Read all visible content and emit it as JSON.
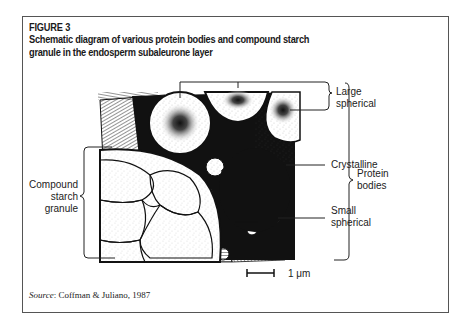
{
  "figure": {
    "label": "FIGURE 3",
    "caption": "Schematic diagram of various protein bodies and compound starch granule in the endosperm subaleurone layer"
  },
  "diagram": {
    "labels": {
      "large_spherical": "Large spherical",
      "large_spherical_line1": "Large",
      "large_spherical_line2": "spherical",
      "crystalline": "Crystalline",
      "small_spherical_line1": "Small",
      "small_spherical_line2": "spherical",
      "protein_bodies_line1": "Protein",
      "protein_bodies_line2": "bodies",
      "compound_starch_line1": "Compound",
      "compound_starch_line2": "starch",
      "compound_starch_line3": "granule"
    },
    "scale_bar": {
      "value": "1",
      "unit": "μm",
      "text": "1 μm"
    }
  },
  "source": {
    "prefix": "Source",
    "text": ": Coffman & Juliano, 1987"
  }
}
